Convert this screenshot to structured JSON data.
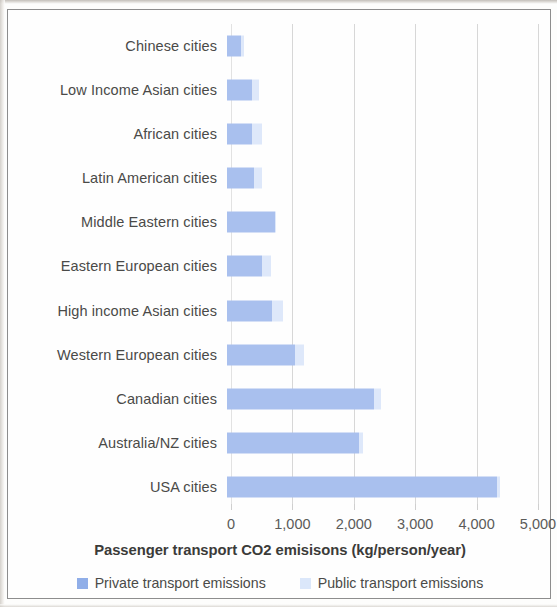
{
  "chart_data": {
    "type": "bar",
    "orientation": "horizontal",
    "stacked": true,
    "title": "",
    "xlabel": "Passenger transport CO2 emisisons (kg/person/year)",
    "ylabel": "",
    "xlim": [
      0,
      5000
    ],
    "xticks": [
      "0",
      "1,000",
      "2,000",
      "3,000",
      "4,000",
      "5,000"
    ],
    "xtick_values": [
      0,
      1000,
      2000,
      3000,
      4000,
      5000
    ],
    "grid": true,
    "grid_axis": "x",
    "legend_position": "bottom",
    "categories": [
      "Chinese cities",
      "Low Income Asian cities",
      "African cities",
      "Latin American cities",
      "Middle Eastern cities",
      "Eastern European cities",
      "High income Asian cities",
      "Western European cities",
      "Canadian cities",
      "Australia/NZ cities",
      "USA cities"
    ],
    "series": [
      {
        "name": "Private transport emissions",
        "color": "#a9c0ee",
        "values": [
          230,
          410,
          410,
          440,
          780,
          570,
          730,
          1110,
          2390,
          2150,
          4400
        ]
      },
      {
        "name": "Public transport emissions",
        "color": "#dee8fa",
        "values": [
          40,
          110,
          160,
          130,
          20,
          140,
          180,
          140,
          120,
          60,
          50
        ]
      }
    ]
  },
  "colors": {
    "private": "#a9c0ee",
    "public": "#dee8fa",
    "legend_private_swatch": "#90aee8",
    "legend_public_swatch": "#dbe7fa",
    "gridline": "#d7d7d7",
    "frame": "#8d8d8d",
    "text": "#4a4a48"
  },
  "legend": {
    "items": [
      {
        "label": "Private transport emissions",
        "swatch": "private-swatch"
      },
      {
        "label": "Public transport emissions",
        "swatch": "public-swatch"
      }
    ]
  }
}
